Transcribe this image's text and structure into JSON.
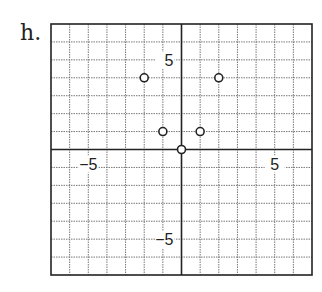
{
  "problem_label": "h.",
  "chart_data": {
    "type": "scatter",
    "title": "",
    "xlabel": "",
    "ylabel": "",
    "xlim": [
      -7,
      7
    ],
    "ylim": [
      -7,
      7
    ],
    "grid": true,
    "tick_labels": {
      "x": [
        {
          "value": -5,
          "label": "−5"
        },
        {
          "value": 5,
          "label": "5"
        }
      ],
      "y": [
        {
          "value": 5,
          "label": "5"
        },
        {
          "value": -5,
          "label": "−5"
        }
      ]
    },
    "series": [
      {
        "name": "points",
        "marker": "open-circle",
        "x": [
          -2,
          2,
          -1,
          1,
          0
        ],
        "y": [
          4,
          4,
          1,
          1,
          0
        ]
      }
    ]
  }
}
